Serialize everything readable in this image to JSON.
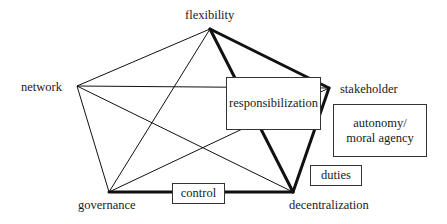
{
  "diagram": {
    "type": "pentagon-network",
    "nodes": {
      "flexibility": {
        "label": "flexibility",
        "x": 210,
        "y": 29
      },
      "stakeholder": {
        "label": "stakeholder",
        "x": 329,
        "y": 88
      },
      "decentralization": {
        "label": "decentralization",
        "x": 293,
        "y": 192
      },
      "governance": {
        "label": "governance",
        "x": 109,
        "y": 192
      },
      "network": {
        "label": "network",
        "x": 77,
        "y": 86
      }
    },
    "thin_edges": [
      [
        "flexibility",
        "network"
      ],
      [
        "flexibility",
        "governance"
      ],
      [
        "network",
        "stakeholder"
      ],
      [
        "network",
        "decentralization"
      ],
      [
        "network",
        "governance"
      ],
      [
        "governance",
        "stakeholder"
      ]
    ],
    "thick_edges": [
      [
        "flexibility",
        "stakeholder"
      ],
      [
        "flexibility",
        "decentralization"
      ],
      [
        "stakeholder",
        "decentralization"
      ],
      [
        "governance",
        "decentralization"
      ]
    ],
    "boxes": {
      "responsibilization": {
        "label": "responsibilization"
      },
      "autonomy": {
        "line1": "autonomy/",
        "line2": "moral agency"
      },
      "duties": {
        "label": "duties"
      },
      "control": {
        "label": "control"
      }
    },
    "colors": {
      "line": "#111111",
      "box_border": "#333333",
      "background": "#ffffff"
    }
  }
}
